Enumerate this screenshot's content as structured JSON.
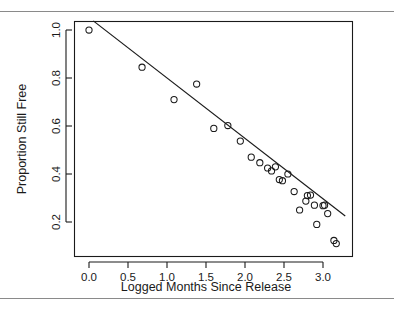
{
  "figure": {
    "background_color": "#ffffff",
    "rule_color": "#8a8a8a",
    "has_top_rule": true,
    "has_bottom_rule": true
  },
  "chart_data": {
    "type": "scatter",
    "title": "",
    "xlabel": "Logged Months Since Release",
    "ylabel": "Proportion Still Free",
    "xlim": [
      -0.18,
      3.32
    ],
    "ylim": [
      0.085,
      1.045
    ],
    "grid": false,
    "legend": null,
    "xticks": [
      0.0,
      0.5,
      1.0,
      1.5,
      2.0,
      2.5,
      3.0
    ],
    "xtick_labels": [
      "0.0",
      "0.5",
      "1.0",
      "1.5",
      "2.0",
      "2.5",
      "3.0"
    ],
    "yticks": [
      0.2,
      0.4,
      0.6,
      0.8,
      1.0
    ],
    "ytick_labels": [
      "0.2",
      "0.4",
      "0.6",
      "0.8",
      "1.0"
    ],
    "marker": "open-circle",
    "marker_color": "#1a1a1a",
    "x": [
      0.0,
      0.68,
      1.09,
      1.38,
      1.6,
      1.78,
      1.94,
      2.08,
      2.19,
      2.29,
      2.34,
      2.39,
      2.44,
      2.48,
      2.55,
      2.63,
      2.7,
      2.78,
      2.8,
      2.84,
      2.89,
      2.92,
      3.0,
      3.02,
      3.06,
      3.14,
      3.17
    ],
    "y": [
      1.0,
      0.845,
      0.71,
      0.775,
      0.59,
      0.602,
      0.537,
      0.47,
      0.447,
      0.425,
      0.413,
      0.43,
      0.377,
      0.372,
      0.4,
      0.327,
      0.25,
      0.287,
      0.31,
      0.312,
      0.27,
      0.19,
      0.268,
      0.27,
      0.235,
      0.123,
      0.11
    ],
    "fit_line": {
      "type": "linear-regression",
      "x_start": 0.055,
      "y_start": 1.038,
      "x_end": 3.285,
      "y_end": 0.225
    }
  },
  "axes": {
    "x_axis_name": "x-axis",
    "y_axis_name": "y-axis"
  }
}
